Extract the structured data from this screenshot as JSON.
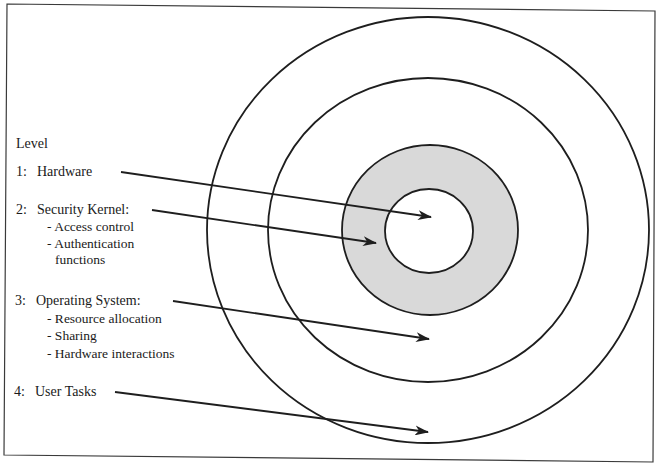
{
  "diagram": {
    "type": "concentric-rings",
    "colors": {
      "line": "#1e1e1e",
      "kernel_fill": "#d9d9d9",
      "background": "#ffffff"
    },
    "legend_title": "Level",
    "levels": [
      {
        "number": "1:",
        "name": "Hardware",
        "items": []
      },
      {
        "number": "2:",
        "name": "Security Kernel:",
        "items": [
          "- Access control",
          "- Authentication",
          "functions"
        ]
      },
      {
        "number": "3:",
        "name": "Operating System:",
        "items": [
          "- Resource allocation",
          "- Sharing",
          "- Hardware interactions"
        ]
      },
      {
        "number": "4:",
        "name": "User Tasks",
        "items": []
      }
    ],
    "rings": [
      {
        "level": "1",
        "label": "Hardware",
        "shaded": false
      },
      {
        "level": "2",
        "label": "Security Kernel",
        "shaded": true
      },
      {
        "level": "3",
        "label": "Operating System",
        "shaded": false
      },
      {
        "level": "4",
        "label": "User Tasks",
        "shaded": false
      }
    ]
  }
}
